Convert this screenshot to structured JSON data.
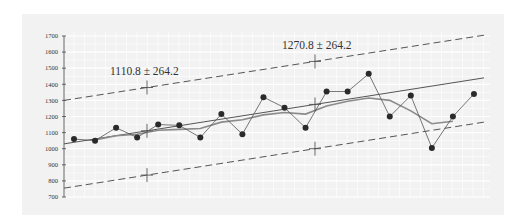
{
  "chart_data": {
    "type": "line",
    "title": "",
    "xlabel": "",
    "ylabel": "",
    "ylim": [
      700,
      1700
    ],
    "yticks": [
      1700,
      1600,
      1500,
      1400,
      1300,
      1200,
      1100,
      1000,
      900,
      800,
      700
    ],
    "ytick_labels": [
      "1700",
      "1600",
      "1500",
      "1400",
      "1300",
      "1200",
      "1100",
      "1000",
      "900",
      "800",
      "700"
    ],
    "grid": true,
    "legend": null,
    "x": [
      1,
      2,
      3,
      4,
      5,
      6,
      7,
      8,
      9,
      10,
      11,
      12,
      13,
      14,
      15,
      16,
      17,
      18,
      19,
      20
    ],
    "series": [
      {
        "name": "observations",
        "style": "line-with-markers",
        "color": "#555555",
        "values": [
          1060,
          1050,
          1130,
          1070,
          1150,
          1145,
          1070,
          1215,
          1090,
          1320,
          1255,
          1130,
          1355,
          1355,
          1465,
          1200,
          1330,
          1005,
          1200,
          1340
        ]
      },
      {
        "name": "moving-average",
        "style": "line",
        "color": "#777777",
        "values": [
          null,
          1055,
          1080,
          1090,
          1115,
          1120,
          1125,
          1165,
          1180,
          1210,
          1225,
          1215,
          1265,
          1295,
          1315,
          1300,
          1235,
          1155,
          1170,
          null
        ]
      },
      {
        "name": "trend",
        "style": "line",
        "color": "#555555",
        "values_at_ends": [
          1030,
          1440
        ]
      },
      {
        "name": "upper-band",
        "style": "dashed",
        "color": "#555555",
        "values_at_ends": [
          1300,
          1705
        ]
      },
      {
        "name": "lower-band",
        "style": "dashed",
        "color": "#555555",
        "values_at_ends": [
          755,
          1165
        ]
      }
    ],
    "annotations": [
      {
        "text": "1110.8 ± 264.2",
        "x_index": 4.5,
        "center": 1110.8,
        "halfwidth": 264.2
      },
      {
        "text": "1270.8 ± 264.2",
        "x_index": 12.6,
        "center": 1270.8,
        "halfwidth": 264.2
      }
    ]
  },
  "colors": {
    "panel_bg": "#f2f2f2",
    "grid": "#ffffff",
    "line": "#555555",
    "marker": "#2a2a2a",
    "ma_line": "#8a8a8a"
  }
}
